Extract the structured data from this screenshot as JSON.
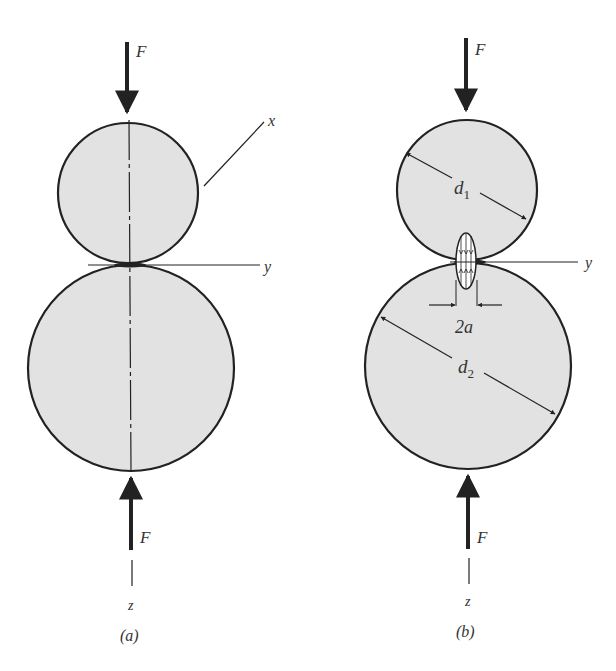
{
  "figure": {
    "panel_a": {
      "caption": "(a)",
      "force_top": "F",
      "force_bottom": "F",
      "axis_x": "x",
      "axis_y": "y",
      "axis_z": "z"
    },
    "panel_b": {
      "caption": "(b)",
      "force_top": "F",
      "force_bottom": "F",
      "axis_y": "y",
      "axis_z": "z",
      "diameter_1": "d",
      "diameter_1_sub": "1",
      "diameter_2": "d",
      "diameter_2_sub": "2",
      "contact_width": "2a"
    },
    "colors": {
      "fill": "#e2e2e2",
      "stroke": "#222222"
    }
  }
}
